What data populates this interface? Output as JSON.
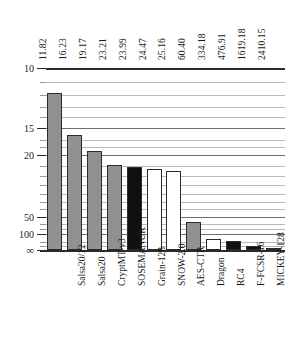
{
  "chart_data": {
    "type": "bar",
    "title": "",
    "subtitle": "",
    "xlabel": "",
    "ylabel": "",
    "grid": true,
    "legend": null,
    "orientation": "vertical",
    "y_axis_inverted": true,
    "y_ticks": [
      "10",
      "15",
      "20",
      "50",
      "100",
      "∞"
    ],
    "y_tick_values": [
      10,
      15,
      20,
      50,
      100,
      "inf"
    ],
    "categories": [
      "Salsa20/12",
      "Salsa20",
      "CryptMT-v3",
      "SOSEMANUK",
      "Grain-128",
      "SNOW-2.0",
      "AES-CTR",
      "Dragon",
      "RC4",
      "F-FCSR-16",
      "MICKEY-128",
      "HC-256"
    ],
    "values": [
      11.82,
      16.23,
      19.17,
      23.21,
      23.99,
      24.47,
      25.16,
      60.4,
      334.18,
      476.91,
      1619.18,
      2410.15
    ],
    "value_labels": [
      "11.82",
      "16.23",
      "19.17",
      "23.21",
      "23.99",
      "24.47",
      "25.16",
      "60.40",
      "334.18",
      "476.91",
      "1619.18",
      "2410.15"
    ],
    "bar_styles": [
      "gray",
      "gray",
      "gray",
      "gray",
      "black",
      "white",
      "white",
      "gray",
      "white",
      "black",
      "black",
      "black"
    ],
    "colors": {
      "gray": "#919191",
      "black": "#101010",
      "white": "#ffffff",
      "outline": "#2b2b2b",
      "gridline": "#b9b9b9",
      "gridline_major": "#6e6e6e"
    }
  }
}
